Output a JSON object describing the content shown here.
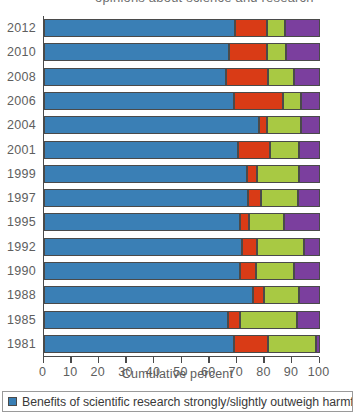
{
  "title_remnant": "opinions about science and research",
  "chart_data": {
    "type": "bar",
    "orientation": "horizontal",
    "stacked": true,
    "title": "",
    "xlabel": "Cumulative percent",
    "ylabel": "",
    "xlim": [
      0,
      100
    ],
    "xticks": [
      0,
      10,
      20,
      30,
      40,
      50,
      60,
      70,
      80,
      90,
      100
    ],
    "xticklabels": [
      "0",
      "10",
      "20",
      "30",
      "40",
      "50",
      "60",
      "70",
      "80",
      "90",
      "100"
    ],
    "grid": false,
    "legend_position": "bottom",
    "categories": [
      "2012",
      "2010",
      "2008",
      "2006",
      "2004",
      "2001",
      "1999",
      "1997",
      "1995",
      "1992",
      "1990",
      "1988",
      "1985",
      "1981"
    ],
    "series": [
      {
        "name": "Benefits of scientific research strongly/slightly outweigh harmful results",
        "color": "#3a7fb5",
        "values": [
          69.5,
          67.0,
          66.0,
          68.9,
          78.2,
          70.3,
          73.7,
          74.2,
          71.0,
          71.8,
          71.0,
          75.8,
          66.7,
          68.9
        ]
      },
      {
        "name": "series-2",
        "color": "#d93b16",
        "values": [
          11.4,
          14.0,
          15.4,
          18.0,
          2.8,
          11.8,
          3.6,
          4.6,
          3.5,
          5.5,
          6.0,
          3.9,
          4.6,
          12.5
        ]
      },
      {
        "name": "series-3",
        "color": "#a8c943",
        "values": [
          6.7,
          6.8,
          9.4,
          6.4,
          12.3,
          10.6,
          15.4,
          13.2,
          12.5,
          16.9,
          13.8,
          13.0,
          20.5,
          17.3
        ]
      },
      {
        "name": "series-4",
        "color": "#7b3f9e",
        "values": [
          12.4,
          12.2,
          9.2,
          6.7,
          6.7,
          7.3,
          7.3,
          8.0,
          13.0,
          5.8,
          9.2,
          7.3,
          8.2,
          1.3
        ]
      }
    ],
    "cumulative_boundaries": [
      {
        "year": "2012",
        "b1": 69.5,
        "b2": 80.9,
        "b3": 87.6,
        "b4": 100
      },
      {
        "year": "2010",
        "b1": 67.0,
        "b2": 81.0,
        "b3": 87.8,
        "b4": 100
      },
      {
        "year": "2008",
        "b1": 66.0,
        "b2": 81.4,
        "b3": 90.8,
        "b4": 100
      },
      {
        "year": "2006",
        "b1": 68.9,
        "b2": 86.9,
        "b3": 93.3,
        "b4": 100
      },
      {
        "year": "2004",
        "b1": 78.2,
        "b2": 81.0,
        "b3": 93.3,
        "b4": 100
      },
      {
        "year": "2001",
        "b1": 70.3,
        "b2": 82.1,
        "b3": 92.7,
        "b4": 100
      },
      {
        "year": "1999",
        "b1": 73.7,
        "b2": 77.3,
        "b3": 92.7,
        "b4": 100
      },
      {
        "year": "1997",
        "b1": 74.2,
        "b2": 78.8,
        "b3": 92.0,
        "b4": 100
      },
      {
        "year": "1995",
        "b1": 71.0,
        "b2": 74.5,
        "b3": 87.0,
        "b4": 100
      },
      {
        "year": "1992",
        "b1": 71.8,
        "b2": 77.3,
        "b3": 94.2,
        "b4": 100
      },
      {
        "year": "1990",
        "b1": 71.0,
        "b2": 77.0,
        "b3": 90.8,
        "b4": 100
      },
      {
        "year": "1988",
        "b1": 75.8,
        "b2": 79.7,
        "b3": 92.7,
        "b4": 100
      },
      {
        "year": "1985",
        "b1": 66.7,
        "b2": 71.3,
        "b3": 91.8,
        "b4": 100
      },
      {
        "year": "1981",
        "b1": 68.9,
        "b2": 81.4,
        "b3": 98.7,
        "b4": 100
      }
    ],
    "legend": [
      {
        "label": "Benefits of scientific research strongly/slightly outweigh harmful results",
        "color": "#3a7fb5"
      }
    ]
  }
}
